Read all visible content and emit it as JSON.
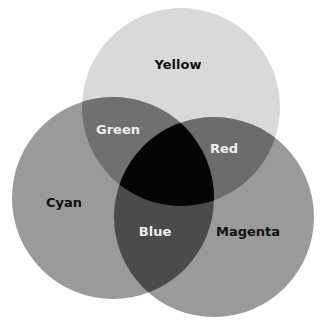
{
  "diagram": {
    "type": "venn",
    "canvas": {
      "width": 325,
      "height": 323,
      "background": "#ffffff"
    },
    "circles": [
      {
        "id": "yellow",
        "label": "Yellow",
        "cx": 181,
        "cy": 107,
        "r": 99,
        "fill": "#d9d9d9",
        "label_x": 178,
        "label_y": 65,
        "label_color": "#111111"
      },
      {
        "id": "cyan",
        "label": "Cyan",
        "cx": 113,
        "cy": 198,
        "r": 101,
        "fill": "#9a9a9a",
        "label_x": 64,
        "label_y": 203,
        "label_color": "#111111"
      },
      {
        "id": "magenta",
        "label": "Magenta",
        "cx": 214,
        "cy": 217,
        "r": 100,
        "fill": "#9a9a9a",
        "label_x": 248,
        "label_y": 232,
        "label_color": "#111111"
      }
    ],
    "intersections": [
      {
        "id": "green",
        "label": "Green",
        "sets": [
          "yellow",
          "cyan"
        ],
        "fill": "#707070",
        "label_x": 118,
        "label_y": 130,
        "label_color": "#eeeeee"
      },
      {
        "id": "red",
        "label": "Red",
        "sets": [
          "yellow",
          "magenta"
        ],
        "fill": "#6c6c6c",
        "label_x": 224,
        "label_y": 149,
        "label_color": "#eeeeee"
      },
      {
        "id": "blue",
        "label": "Blue",
        "sets": [
          "cyan",
          "magenta"
        ],
        "fill": "#4b4b4b",
        "label_x": 155,
        "label_y": 232,
        "label_color": "#eeeeee"
      },
      {
        "id": "center",
        "label": "",
        "sets": [
          "yellow",
          "cyan",
          "magenta"
        ],
        "fill": "#050505"
      }
    ]
  },
  "labels": {
    "yellow": "Yellow",
    "cyan": "Cyan",
    "magenta": "Magenta",
    "green": "Green",
    "red": "Red",
    "blue": "Blue"
  }
}
